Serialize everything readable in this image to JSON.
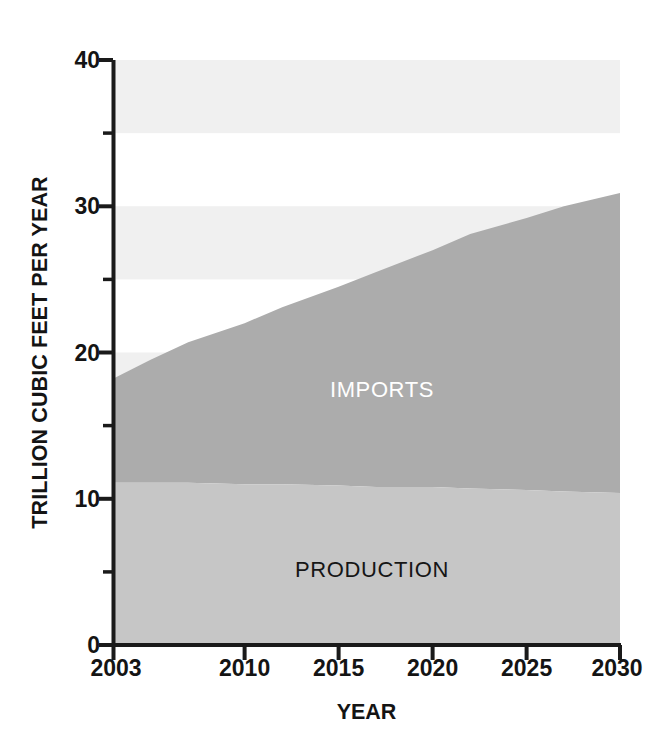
{
  "chart_data": {
    "type": "area",
    "title": "",
    "subtitle": "",
    "xlabel": "YEAR",
    "ylabel": "TRILLION CUBIC FEET PER YEAR",
    "xlim": [
      2003,
      2030
    ],
    "ylim": [
      0,
      40
    ],
    "stacked": true,
    "grid": "horizontal-bands",
    "legend": "in-plot-labels",
    "x": [
      2003,
      2005,
      2007,
      2010,
      2012,
      2015,
      2017,
      2020,
      2022,
      2025,
      2027,
      2030
    ],
    "xtick_labels": [
      "2003",
      "2010",
      "2015",
      "2020",
      "2025",
      "2030"
    ],
    "xtick_values": [
      2003,
      2010,
      2015,
      2020,
      2025,
      2030
    ],
    "ytick_labels": [
      "0",
      "10",
      "20",
      "30",
      "40"
    ],
    "ytick_values": [
      0,
      10,
      20,
      30,
      40
    ],
    "yminor_tick_values": [
      5,
      15,
      25,
      35
    ],
    "series": [
      {
        "name": "PRODUCTION",
        "color": "#c6c6c6",
        "label_color": "#161616",
        "values": [
          11.1,
          11.1,
          11.1,
          11.0,
          11.0,
          10.9,
          10.8,
          10.8,
          10.7,
          10.6,
          10.5,
          10.4
        ]
      },
      {
        "name": "IMPORTS",
        "color": "#acacac",
        "label_color": "#ffffff",
        "values": [
          7.1,
          8.4,
          9.6,
          11.0,
          12.1,
          13.6,
          14.7,
          16.2,
          17.4,
          18.6,
          19.5,
          20.5
        ]
      }
    ],
    "totals": [
      18.2,
      19.5,
      20.7,
      22.0,
      23.1,
      24.5,
      25.5,
      27.0,
      28.1,
      29.2,
      30.0,
      30.9
    ],
    "band_color": "#f0f0f0",
    "band_ranges": [
      [
        35,
        40
      ],
      [
        25,
        30
      ],
      [
        15,
        20
      ],
      [
        5,
        10
      ]
    ]
  },
  "axis": {
    "y_title": "TRILLION CUBIC FEET PER YEAR",
    "x_title": "YEAR",
    "y_ticks": [
      "40",
      "30",
      "20",
      "10",
      "0"
    ],
    "x_ticks": [
      "2003",
      "2010",
      "2015",
      "2020",
      "2025",
      "2030"
    ]
  },
  "labels": {
    "imports": "IMPORTS",
    "production": "PRODUCTION"
  },
  "colors": {
    "production_fill": "#c6c6c6",
    "imports_fill": "#acacac",
    "band_fill": "#f0f0f0",
    "axis_line": "#1a1a1a",
    "text": "#141414"
  }
}
